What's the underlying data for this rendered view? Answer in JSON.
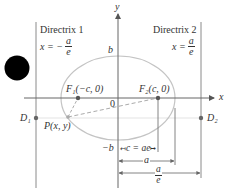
{
  "colors": {
    "line": "#7a7a7a",
    "ellipse": "#c8c8c8",
    "dashed": "#a8a8a8",
    "point": "#555555",
    "text": "#333333",
    "blackDot": "#000000"
  },
  "directrix1": {
    "title": "Directrix 1",
    "eq_prefix": "x = −",
    "eq_num": "a",
    "eq_den": "e"
  },
  "directrix2": {
    "title": "Directrix 2",
    "eq_prefix": "x =",
    "eq_num": "a",
    "eq_den": "e"
  },
  "axes": {
    "x_label": "x",
    "y_label": "y",
    "origin_label": "0"
  },
  "ellipse_labels": {
    "b_top": "b",
    "b_bottom": "−b"
  },
  "points": {
    "F1": "F₁(−c, 0)",
    "F2": "F₂(c, 0)",
    "P": "P(x, y)",
    "D1": "D₁",
    "D2": "D₂"
  },
  "dimensions": {
    "c": "c = ae",
    "a": "a",
    "ae_num": "a",
    "ae_den": "e"
  }
}
